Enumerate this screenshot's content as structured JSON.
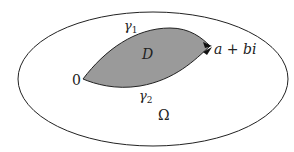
{
  "diagram": {
    "region_outer": {
      "label": "Ω"
    },
    "region_inner": {
      "label": "D",
      "fill": "#9a9a9a"
    },
    "curve_upper": {
      "label": "γ",
      "subscript": "1"
    },
    "curve_lower": {
      "label": "γ",
      "subscript": "2"
    },
    "start_point": {
      "label": "0"
    },
    "end_point": {
      "label": "a + bi"
    }
  }
}
